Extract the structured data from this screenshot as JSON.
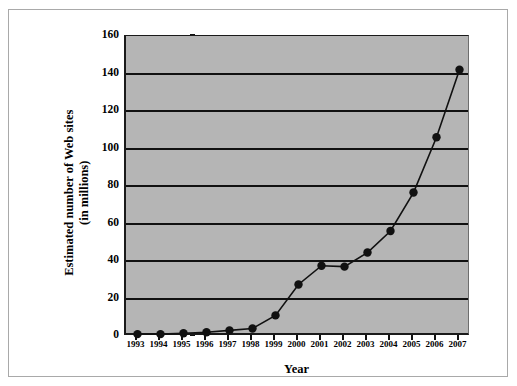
{
  "chart_data": {
    "type": "line",
    "title": "",
    "xlabel": "Year",
    "ylabel": "Estimated number of Web sites\n(in millions)",
    "ylabel_line1": "Estimated number of Web sites",
    "ylabel_line2": "(in millions)",
    "categories": [
      "1993",
      "1994",
      "1995",
      "1996",
      "1997",
      "1998",
      "1999",
      "2000",
      "2001",
      "2002",
      "2003",
      "2004",
      "2005",
      "2006",
      "2007"
    ],
    "values": [
      1,
      1,
      1.5,
      2,
      3,
      4,
      11,
      27.5,
      37.5,
      37,
      44.5,
      56,
      76.5,
      106,
      142
    ],
    "ylim": [
      0,
      160
    ],
    "yticks": [
      0,
      20,
      40,
      60,
      80,
      100,
      120,
      140,
      160
    ],
    "ytick_labels": [
      "0",
      "20",
      "40",
      "60",
      "80",
      "100",
      "120",
      "140",
      "160"
    ],
    "grid": true,
    "grid_axis": "y",
    "legend": false,
    "marker": "circle",
    "series_color": "#111111",
    "plot_background": "#b5b5b5",
    "figure_background": "#ffffff"
  }
}
